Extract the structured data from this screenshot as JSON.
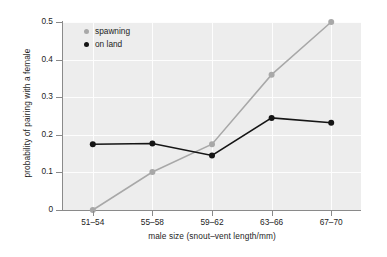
{
  "chart_data": {
    "type": "line",
    "title": "",
    "xlabel": "male size (snout–vent length/mm)",
    "ylabel": "probability of pairing with a female",
    "categories": [
      "51–54",
      "55–58",
      "59–62",
      "63–66",
      "67–70"
    ],
    "ylim": [
      0,
      0.5
    ],
    "yticks": [
      "0",
      "0.1",
      "0.2",
      "0.3",
      "0.4",
      "0.5"
    ],
    "ytick_values": [
      0,
      0.1,
      0.2,
      0.3,
      0.4,
      0.5
    ],
    "grid": true,
    "legend_position": "top-left",
    "series": [
      {
        "name": "spawning",
        "color": "#a8a8a8",
        "marker": "circle",
        "values": [
          0.0,
          0.101,
          0.175,
          0.36,
          0.5
        ]
      },
      {
        "name": "on land",
        "color": "#151515",
        "marker": "circle",
        "values": [
          0.175,
          0.177,
          0.145,
          0.245,
          0.232
        ]
      }
    ]
  },
  "legend": {
    "items": [
      {
        "label": "spawning",
        "color": "#a8a8a8"
      },
      {
        "label": "on land",
        "color": "#151515"
      }
    ]
  },
  "colors": {
    "plot_background": "#ededed",
    "gridline": "#fdfdfd",
    "axis": "#8a8a8a",
    "spawning": "#a8a8a8",
    "on_land": "#151515"
  }
}
